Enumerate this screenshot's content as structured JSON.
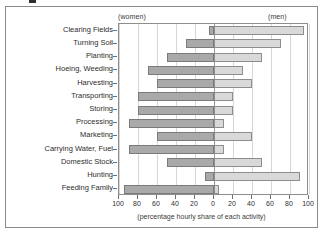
{
  "header": {
    "left_label": "(women)",
    "right_label": "(men)"
  },
  "axis": {
    "x_title": "(percentage hourly share of each activity)",
    "x_ticks": [
      "100",
      "80",
      "60",
      "40",
      "20",
      "0",
      "20",
      "40",
      "60",
      "80",
      "100"
    ]
  },
  "colors": {
    "women_fill": "#a9a9a9",
    "women_stroke": "#7b7b7b",
    "men_fill": "#d9d9d9",
    "men_stroke": "#8d8d8d",
    "grid": "#d7d7d7",
    "axis": "#8e8e8e",
    "frame": "#8a8a8a",
    "text": "#2e2e2e"
  },
  "chart_data": {
    "type": "bar",
    "orientation": "horizontal",
    "layout": "diverging-population-pyramid",
    "title": "",
    "subtitle": "",
    "xlabel": "(percentage hourly share of each activity)",
    "ylabel": "",
    "xlim": [
      -100,
      100
    ],
    "xticks": [
      -100,
      -80,
      -60,
      -40,
      -20,
      0,
      20,
      40,
      60,
      80,
      100
    ],
    "xticklabels": [
      "100",
      "80",
      "60",
      "40",
      "20",
      "0",
      "20",
      "40",
      "60",
      "80",
      "100"
    ],
    "grid": true,
    "legend": "axis-header-labels",
    "legend_position": "top",
    "categories": [
      "Clearing Fields",
      "Turning Soil",
      "Planting",
      "Hoeing, Weeding",
      "Harvesting",
      "Transporting",
      "Storing",
      "Processing",
      "Marketing",
      "Carrying Water, Fuel",
      "Domestic Stock",
      "Hunting",
      "Feeding Family"
    ],
    "series": [
      {
        "name": "(women)",
        "side": "left",
        "color": "#a9a9a9",
        "values": [
          5,
          30,
          50,
          70,
          60,
          80,
          80,
          90,
          60,
          90,
          50,
          10,
          95
        ]
      },
      {
        "name": "(men)",
        "side": "right",
        "color": "#d9d9d9",
        "values": [
          95,
          70,
          50,
          30,
          40,
          20,
          20,
          10,
          40,
          10,
          50,
          90,
          5
        ]
      }
    ]
  }
}
